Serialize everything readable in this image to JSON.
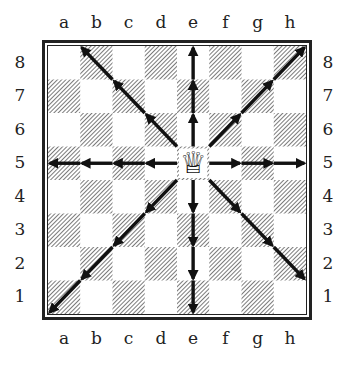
{
  "diagram": {
    "files": [
      "a",
      "b",
      "c",
      "d",
      "e",
      "f",
      "g",
      "h"
    ],
    "ranks": [
      "8",
      "7",
      "6",
      "5",
      "4",
      "3",
      "2",
      "1"
    ],
    "piece": {
      "type": "queen",
      "color": "white",
      "square": "e5",
      "glyph": "♕"
    },
    "arrows": [
      {
        "direction": "north",
        "from": "e5",
        "to": "e8"
      },
      {
        "direction": "south",
        "from": "e5",
        "to": "e1"
      },
      {
        "direction": "west",
        "from": "e5",
        "to": "a5"
      },
      {
        "direction": "east",
        "from": "e5",
        "to": "h5"
      },
      {
        "direction": "north-west",
        "from": "e5",
        "to": "b8"
      },
      {
        "direction": "north-east",
        "from": "e5",
        "to": "h8"
      },
      {
        "direction": "south-west",
        "from": "e5",
        "to": "a1"
      },
      {
        "direction": "south-east",
        "from": "e5",
        "to": "h2"
      }
    ],
    "colors": {
      "ink": "#222222",
      "light_square": "#ffffff",
      "dark_square_hatch": "#333333"
    }
  }
}
